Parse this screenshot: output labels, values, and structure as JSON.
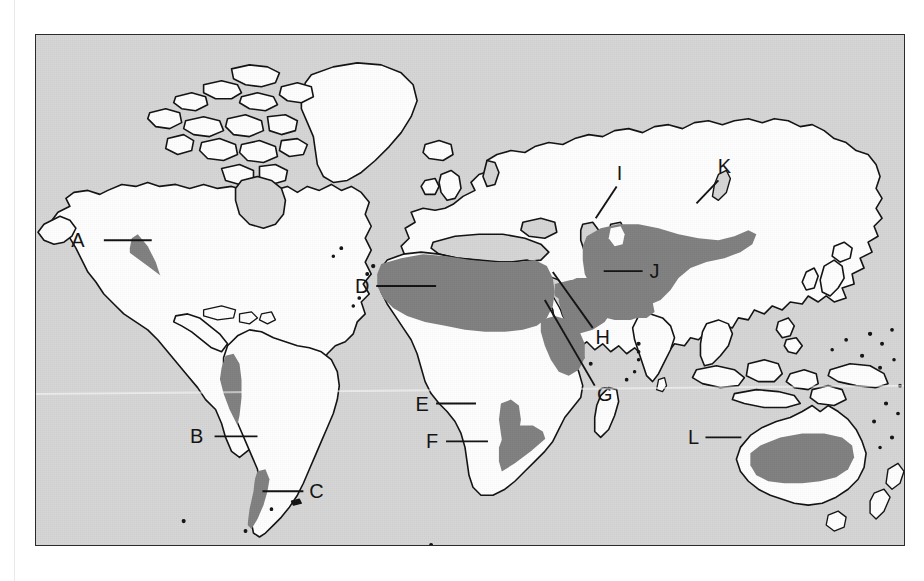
{
  "figure": {
    "type": "map",
    "frame": {
      "border_color": "#2b2b2b",
      "x": 35,
      "y": 34,
      "width": 870,
      "height": 512
    }
  },
  "colors": {
    "ocean": "#d6d6d6",
    "land": "#ffffff",
    "desert_shading": "#808080",
    "coastline": "#111111",
    "label_text": "#111111",
    "page_background": "#ffffff"
  },
  "legend": {
    "land_fill_meaning": "land (unshaded, white)",
    "ocean_fill_meaning": "ocean / sea (light gray)",
    "shaded_fill_meaning": "desert region (medium gray)"
  },
  "labels": [
    {
      "id": "A",
      "text": "A",
      "label_x": 85,
      "label_y": 246,
      "leader_x1": 103,
      "leader_y1": 240,
      "leader_x2": 151,
      "leader_y2": 240,
      "region": "north-america-west"
    },
    {
      "id": "B",
      "text": "B",
      "label_x": 196,
      "label_y": 443,
      "leader_x1": 214,
      "leader_y1": 437,
      "leader_x2": 257,
      "leader_y2": 437,
      "region": "south-america-west"
    },
    {
      "id": "C",
      "text": "C",
      "label_x": 310,
      "label_y": 498,
      "leader_x1": 262,
      "leader_y1": 492,
      "leader_x2": 303,
      "leader_y2": 492,
      "region": "south-america-south"
    },
    {
      "id": "D",
      "text": "D",
      "label_x": 357,
      "label_y": 292,
      "leader_x1": 376,
      "leader_y1": 286,
      "leader_x2": 436,
      "leader_y2": 286,
      "region": "north-africa"
    },
    {
      "id": "E",
      "text": "E",
      "label_x": 418,
      "label_y": 410,
      "leader_x1": 436,
      "leader_y1": 404,
      "leader_x2": 476,
      "leader_y2": 404,
      "region": "southwest-africa-coast"
    },
    {
      "id": "F",
      "text": "F",
      "label_x": 428,
      "label_y": 448,
      "leader_x1": 446,
      "leader_y1": 442,
      "leader_x2": 488,
      "leader_y2": 442,
      "region": "southern-africa"
    },
    {
      "id": "G",
      "text": "G",
      "label_x": 598,
      "label_y": 394,
      "leader_x1": 595,
      "leader_y1": 386,
      "leader_x2": 545,
      "leader_y2": 300,
      "region": "horn-of-africa"
    },
    {
      "id": "H",
      "text": "H",
      "label_x": 596,
      "label_y": 337,
      "leader_x1": 593,
      "leader_y1": 328,
      "leader_x2": 553,
      "leader_y2": 272,
      "region": "arabian-peninsula"
    },
    {
      "id": "I",
      "text": "I",
      "label_x": 619,
      "label_y": 180,
      "leader_x1": 617,
      "leader_y1": 186,
      "leader_x2": 596,
      "leader_y2": 218,
      "region": "central-asia"
    },
    {
      "id": "J",
      "text": "J",
      "label_x": 648,
      "label_y": 277,
      "leader_x1": 643,
      "leader_y1": 271,
      "leader_x2": 604,
      "leader_y2": 271,
      "region": "iran-afghanistan-thar"
    },
    {
      "id": "K",
      "text": "K",
      "label_x": 722,
      "label_y": 173,
      "leader_x1": 719,
      "leader_y1": 180,
      "leader_x2": 697,
      "leader_y2": 203,
      "region": "gobi-east"
    },
    {
      "id": "L",
      "text": "L",
      "label_x": 692,
      "label_y": 444,
      "leader_x1": 706,
      "leader_y1": 438,
      "leader_x2": 742,
      "leader_y2": 438,
      "region": "australia-interior"
    }
  ],
  "regions": [
    {
      "id": "A",
      "name": "Western North America desert belt"
    },
    {
      "id": "B",
      "name": "Atacama / Andean coastal desert"
    },
    {
      "id": "C",
      "name": "Patagonian desert"
    },
    {
      "id": "D",
      "name": "Sahara"
    },
    {
      "id": "E",
      "name": "Namib coastal desert"
    },
    {
      "id": "F",
      "name": "Kalahari / Karoo"
    },
    {
      "id": "G",
      "name": "Somali / Horn of Africa desert"
    },
    {
      "id": "H",
      "name": "Arabian desert"
    },
    {
      "id": "I",
      "name": "Central Asian desert (Kara Kum / Kyzyl Kum)"
    },
    {
      "id": "J",
      "name": "Iranian / Thar desert belt"
    },
    {
      "id": "K",
      "name": "Gobi desert"
    },
    {
      "id": "L",
      "name": "Australian interior desert"
    }
  ]
}
